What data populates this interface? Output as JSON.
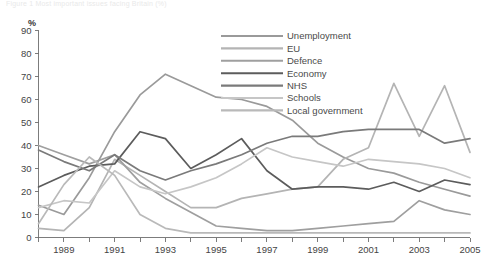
{
  "top_partial_text": "Figure 1  Most important issues facing Britain (%)",
  "chart_data": {
    "type": "line",
    "title": "",
    "subtitle": "",
    "xlabel": "",
    "ylabel": "%",
    "ylim": [
      0,
      90
    ],
    "ytick_step": 10,
    "yticks": [
      0,
      10,
      20,
      30,
      40,
      50,
      60,
      70,
      80,
      90
    ],
    "ytick_labels": [
      "0",
      "10",
      "20",
      "30",
      "40",
      "50",
      "60",
      "70",
      "80",
      "90"
    ],
    "xlim": [
      1988,
      2005
    ],
    "x": [
      1988,
      1989,
      1990,
      1991,
      1992,
      1993,
      1994,
      1995,
      1996,
      1997,
      1998,
      1999,
      2000,
      2001,
      2002,
      2003,
      2004,
      2005
    ],
    "xticks": [
      1988,
      1989,
      1990,
      1991,
      1992,
      1993,
      1994,
      1995,
      1996,
      1997,
      1998,
      1999,
      2000,
      2001,
      2002,
      2003,
      2004,
      2005
    ],
    "xtick_labels_shown": [
      "1989",
      "1991",
      "1993",
      "1995",
      "1997",
      "1999",
      "2001",
      "2003",
      "2005"
    ],
    "grid": false,
    "legend_position": "top-right",
    "series": [
      {
        "name": "Unemployment",
        "color": "#9a9a9a",
        "values": [
          14,
          10,
          26,
          46,
          62,
          71,
          66,
          61,
          60,
          57,
          51,
          41,
          35,
          30,
          28,
          24,
          21,
          18
        ]
      },
      {
        "name": "EU",
        "color": "#b4b4b4",
        "values": [
          4,
          3,
          13,
          34,
          27,
          20,
          13,
          13,
          17,
          19,
          21,
          22,
          34,
          39,
          67,
          44,
          66,
          37
        ]
      },
      {
        "name": "Defence",
        "color": "#9f9f9f",
        "values": [
          40,
          36,
          32,
          36,
          24,
          17,
          11,
          5,
          4,
          3,
          3,
          4,
          5,
          6,
          7,
          16,
          12,
          10
        ]
      },
      {
        "name": "Economy",
        "color": "#5c5c5c",
        "values": [
          22,
          27,
          31,
          32,
          46,
          43,
          30,
          36,
          43,
          29,
          21,
          22,
          22,
          21,
          24,
          20,
          25,
          23
        ]
      },
      {
        "name": "NHS",
        "color": "#7a7a7a",
        "values": [
          38,
          33,
          29,
          36,
          29,
          25,
          29,
          32,
          36,
          41,
          44,
          44,
          46,
          47,
          47,
          47,
          41,
          43
        ]
      },
      {
        "name": "Schools",
        "color": "#c6c6c6",
        "values": [
          13,
          16,
          15,
          29,
          22,
          19,
          22,
          26,
          32,
          39,
          35,
          33,
          31,
          34,
          33,
          32,
          30,
          26
        ]
      },
      {
        "name": "Local government",
        "color": "#b9b9b9",
        "values": [
          6,
          23,
          35,
          27,
          10,
          4,
          2,
          2,
          2,
          2,
          2,
          2,
          2,
          2,
          2,
          2,
          2,
          2
        ]
      }
    ]
  },
  "legend": {
    "items": [
      {
        "label": "Unemployment"
      },
      {
        "label": "EU"
      },
      {
        "label": "Defence"
      },
      {
        "label": "Economy"
      },
      {
        "label": "NHS"
      },
      {
        "label": "Schools"
      },
      {
        "label": "Local government"
      }
    ]
  }
}
